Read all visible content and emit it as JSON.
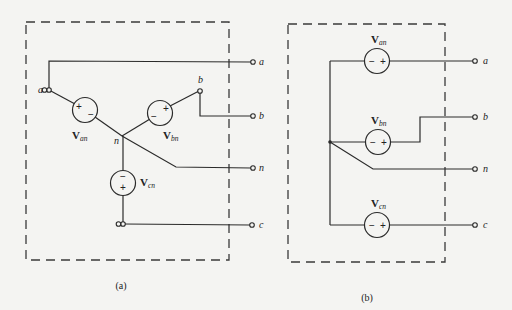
{
  "figure": {
    "panels": [
      {
        "id": "a",
        "caption": "(a)",
        "topology": "wye",
        "node_labels": {
          "a": "a",
          "b": "b",
          "n": "n"
        },
        "sources": [
          {
            "name": "V",
            "sub": "an",
            "polarity_first": "+",
            "polarity_second": "−"
          },
          {
            "name": "V",
            "sub": "bn",
            "polarity_first": "−",
            "polarity_second": "+"
          },
          {
            "name": "V",
            "sub": "cn",
            "polarity_first": "−",
            "polarity_second": "+"
          }
        ],
        "terminals": [
          "a",
          "b",
          "n",
          "c"
        ]
      },
      {
        "id": "b",
        "caption": "(b)",
        "topology": "parallel-common-neutral",
        "sources": [
          {
            "name": "V",
            "sub": "an",
            "polarity_first": "−",
            "polarity_second": "+"
          },
          {
            "name": "V",
            "sub": "bn",
            "polarity_first": "−",
            "polarity_second": "+"
          },
          {
            "name": "V",
            "sub": "cn",
            "polarity_first": "−",
            "polarity_second": "+"
          }
        ],
        "terminals": [
          "a",
          "b",
          "n",
          "c"
        ]
      }
    ]
  }
}
